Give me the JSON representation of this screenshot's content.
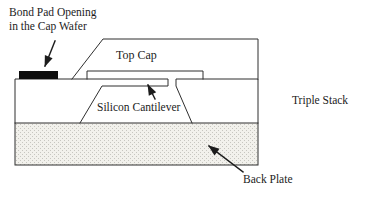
{
  "diagram": {
    "labels": {
      "bond_pad_line1": "Bond Pad Opening",
      "bond_pad_line2": "in the Cap Wafer",
      "top_cap": "Top Cap",
      "silicon_cantilever": "Silicon Cantilever",
      "triple_stack": "Triple Stack",
      "back_plate": "Back Plate"
    },
    "colors": {
      "line": "#2e2e2e",
      "bond_pad": "#0d0d0d",
      "back_plate_bg": "#f2f1ec",
      "back_plate_dot": "#c7c6c0",
      "text": "#1c1c1c",
      "background": "#ffffff"
    }
  }
}
